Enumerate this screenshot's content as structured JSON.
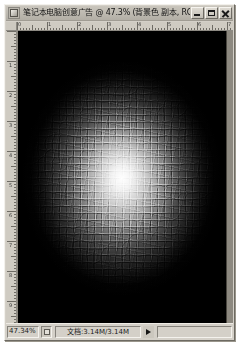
{
  "window": {
    "title": "笔记本电脑创意广告 @ 47.3% (背景色 副本, RGB/8)",
    "icon": "photoshop-document-icon",
    "controls": {
      "minimize": "minimize-icon",
      "maximize": "maximize-icon",
      "close": "close-icon"
    }
  },
  "rulers": {
    "unit": "px",
    "horizontal_labels": [
      "0",
      "1",
      "2",
      "3",
      "4",
      "5",
      "6",
      "7"
    ],
    "vertical_labels": [
      "0",
      "1",
      "2",
      "3",
      "4",
      "5",
      "6",
      "7",
      "8",
      "9",
      "10"
    ]
  },
  "canvas": {
    "description": "mosaic-textured radial glow, bright center fading to black edges",
    "center_color": "#ffffff",
    "edge_color": "#000000",
    "mosaic_cell_px": 7
  },
  "status_bar": {
    "zoom_level": "47.34%",
    "zoom_grip": "resize-grip-icon",
    "doc_info": "文档:3.14M/3.14M",
    "popup_arrow": "popup-arrow-icon"
  }
}
